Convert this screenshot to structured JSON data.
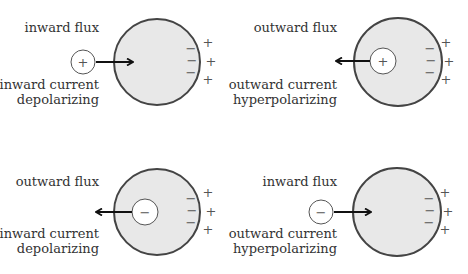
{
  "colors": {
    "cell_fill": "#e8e8e8",
    "cell_stroke": "#444444",
    "ion_fill": "#ffffff",
    "ion_stroke": "#555555",
    "arrow": "#111111",
    "text": "#333333",
    "sign": "#555555"
  },
  "panels": [
    {
      "id": "top-left",
      "flux_label": "inward flux",
      "current_label": "inward current",
      "effect_label": "depolarizing",
      "ion_charge": "+",
      "flux_direction": "inward",
      "membrane_inside_signs": [
        "−",
        "−",
        "−"
      ],
      "membrane_outside_signs": [
        "+",
        "+",
        "+"
      ]
    },
    {
      "id": "top-right",
      "flux_label": "outward flux",
      "current_label": "outward current",
      "effect_label": "hyperpolarizing",
      "ion_charge": "+",
      "flux_direction": "outward",
      "membrane_inside_signs": [
        "−",
        "−",
        "−"
      ],
      "membrane_outside_signs": [
        "+",
        "+",
        "+"
      ]
    },
    {
      "id": "bottom-left",
      "flux_label": "outward flux",
      "current_label": "inward current",
      "effect_label": "depolarizing",
      "ion_charge": "−",
      "flux_direction": "outward",
      "membrane_inside_signs": [
        "−",
        "−",
        "−"
      ],
      "membrane_outside_signs": [
        "+",
        "+",
        "+"
      ]
    },
    {
      "id": "bottom-right",
      "flux_label": "inward flux",
      "current_label": "outward current",
      "effect_label": "hyperpolarizing",
      "ion_charge": "−",
      "flux_direction": "inward",
      "membrane_inside_signs": [
        "−",
        "−",
        "−"
      ],
      "membrane_outside_signs": [
        "+",
        "+",
        "+"
      ]
    }
  ]
}
